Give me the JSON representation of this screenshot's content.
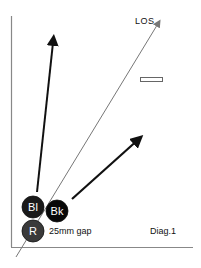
{
  "diagram": {
    "title": "Diag.1",
    "los_label": "LOS",
    "gap_label": "25mm gap",
    "balls": [
      {
        "label": "Bl",
        "name": "blue-ball",
        "color": "#1a1a1a",
        "cx": 33,
        "cy": 207,
        "r": 11
      },
      {
        "label": "Bk",
        "name": "black-ball",
        "color": "#080808",
        "cx": 57,
        "cy": 211,
        "r": 11
      },
      {
        "label": "R",
        "name": "red-ball",
        "color": "#3a3a3a",
        "cx": 33,
        "cy": 231,
        "r": 11
      }
    ],
    "arrows": [
      {
        "name": "blue-ball-path-arrow",
        "x1": 37,
        "y1": 192,
        "x2": 54,
        "y2": 34
      },
      {
        "name": "black-ball-path-arrow",
        "x1": 72,
        "y1": 199,
        "x2": 143,
        "y2": 135
      }
    ],
    "los_line": {
      "x1": 16,
      "y1": 257,
      "x2": 161,
      "y2": 19
    },
    "marker": {
      "x": 140,
      "y": 77,
      "w": 22,
      "h": 4
    },
    "colors": {
      "line": "#777777",
      "arrow": "#111111",
      "frame": "#888888"
    }
  }
}
